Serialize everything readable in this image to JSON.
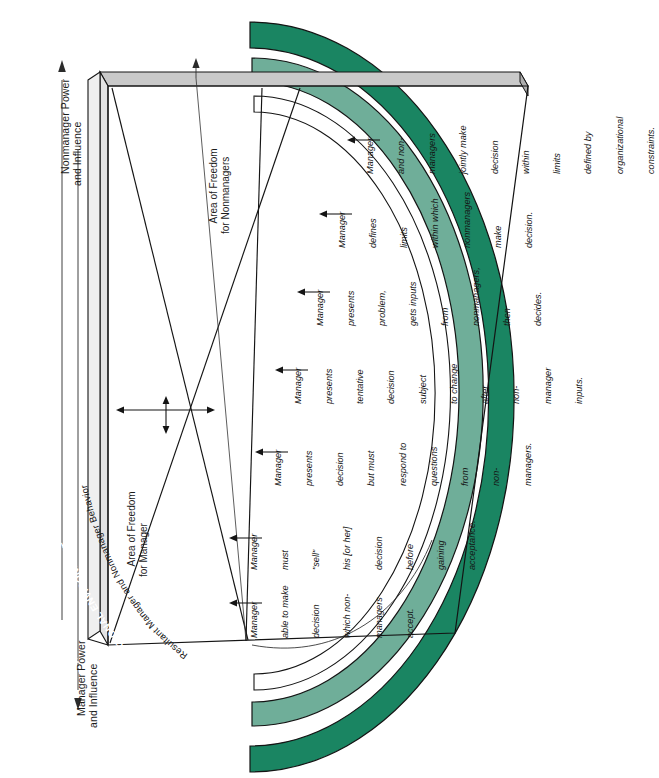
{
  "figure": {
    "orientation": "rotated-90-ccw"
  },
  "axes": {
    "nonmanager_power": "Nonmanager Power\nand Influence",
    "manager_power": "Manager Power\nand Influence",
    "area_freedom_nonmanagers": "Area of Freedom\nfor Nonmanagers",
    "area_freedom_manager": "Area of Freedom\nfor Manager"
  },
  "rings": {
    "societal": "THE SOCIETAL ENVIRONMENT",
    "organizational": "THE ORGANIZATIONAL ENVIRONMENT",
    "resultant": "Resultant Manager and Nonmanager Behavior"
  },
  "colors": {
    "dark_green": "#1a8562",
    "light_green": "#6fae99",
    "box_top_gray": "#c9c9c9",
    "box_side_gray": "#e3e3e3",
    "outline": "#1a1a1a",
    "white": "#ffffff"
  },
  "continuum": [
    {
      "index": 1,
      "lines": [
        "Manager",
        "able to make",
        "decision",
        "which non-",
        "managers",
        "accept."
      ]
    },
    {
      "index": 2,
      "lines": [
        "Manager",
        "must",
        "\"sell\"",
        "his [or her]",
        "decision",
        "before",
        "gaining",
        "acceptance."
      ]
    },
    {
      "index": 3,
      "lines": [
        "Manager",
        "presents",
        "decision",
        "but must",
        "respond to",
        "questions",
        "from",
        "non-",
        "managers."
      ]
    },
    {
      "index": 4,
      "lines": [
        "Manager",
        "presents",
        "tentative",
        "decision",
        "subject",
        "to change",
        "after",
        "non-",
        "manager",
        "inputs."
      ]
    },
    {
      "index": 5,
      "lines": [
        "Manager",
        "presents",
        "problem,",
        "gets inputs",
        "from",
        "nonmanagers,",
        "then",
        "decides."
      ]
    },
    {
      "index": 6,
      "lines": [
        "Manager",
        "defines",
        "limits",
        "within which",
        "nonmanagers",
        "make",
        "decision."
      ]
    },
    {
      "index": 7,
      "lines": [
        "Manager",
        "and non-",
        "managers",
        "jointly make",
        "decision",
        "within",
        "limits",
        "defined by",
        "organizational",
        "constraints."
      ]
    }
  ]
}
